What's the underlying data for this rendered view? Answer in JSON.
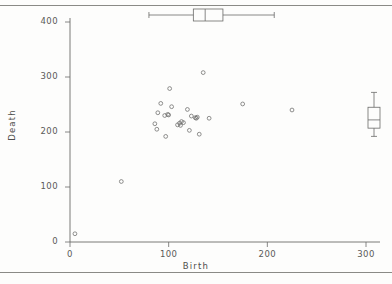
{
  "figure": {
    "kind": "scatter-with-marginal-boxplots",
    "background": "#fdfdfc",
    "ink": "#6b6b69"
  },
  "axes": {
    "x_title": "Birth",
    "y_title": "Death",
    "x_ticks": [
      "0",
      "100",
      "200",
      "300"
    ],
    "y_ticks": [
      "0",
      "100",
      "200",
      "300",
      "400"
    ]
  },
  "chart_data": {
    "type": "scatter",
    "title": "",
    "xlabel": "Birth",
    "ylabel": "Death",
    "xlim": [
      0,
      310
    ],
    "ylim": [
      0,
      420
    ],
    "xticks": [
      0,
      100,
      200,
      300
    ],
    "yticks": [
      0,
      100,
      200,
      300,
      400
    ],
    "grid": false,
    "legend": false,
    "marker": "open-circle",
    "points": [
      [
        5,
        15
      ],
      [
        52,
        110
      ],
      [
        86,
        215
      ],
      [
        88,
        205
      ],
      [
        89,
        235
      ],
      [
        92,
        252
      ],
      [
        96,
        230
      ],
      [
        97,
        192
      ],
      [
        99,
        232
      ],
      [
        100,
        231
      ],
      [
        101,
        279
      ],
      [
        103,
        246
      ],
      [
        109,
        213
      ],
      [
        111,
        216
      ],
      [
        112,
        212
      ],
      [
        113,
        219
      ],
      [
        115,
        217
      ],
      [
        119,
        241
      ],
      [
        121,
        203
      ],
      [
        123,
        229
      ],
      [
        127,
        226
      ],
      [
        128,
        225
      ],
      [
        129,
        227
      ],
      [
        131,
        196
      ],
      [
        135,
        308
      ],
      [
        141,
        225
      ],
      [
        175,
        251
      ],
      [
        225,
        240
      ]
    ],
    "marginal_boxplots": [
      {
        "orientation": "horizontal",
        "variable": "Birth",
        "whisker_low": 80,
        "q1": 125,
        "median": 137,
        "q3": 155,
        "whisker_high": 207
      },
      {
        "orientation": "vertical",
        "variable": "Death",
        "whisker_low": 192,
        "q1": 207,
        "median": 222,
        "q3": 245,
        "whisker_high": 272
      }
    ]
  }
}
